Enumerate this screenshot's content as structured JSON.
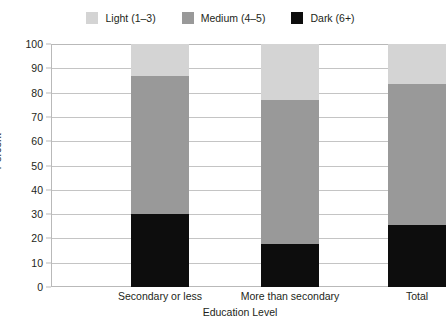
{
  "chart_data": {
    "type": "bar",
    "subtype": "stacked",
    "title": "",
    "xlabel": "Education Level",
    "ylabel": "Percent",
    "ylim": [
      0,
      100
    ],
    "yticks": [
      0,
      10,
      20,
      30,
      40,
      50,
      60,
      70,
      80,
      90,
      100
    ],
    "ytick_labels": [
      "0",
      "10",
      "20",
      "30",
      "40",
      "50",
      "60",
      "70",
      "80",
      "90",
      "100"
    ],
    "grid": true,
    "legend_position": "top-center",
    "categories": [
      "Secondary or less",
      "More than secondary",
      "Total"
    ],
    "series": [
      {
        "name": "Dark (6+)",
        "color": "#0d0d0d",
        "values": [
          30.0,
          17.5,
          25.5
        ]
      },
      {
        "name": "Medium (4–5)",
        "color": "#999999",
        "values": [
          57.0,
          59.5,
          58.0
        ]
      },
      {
        "name": "Light (1–3)",
        "color": "#d4d4d4",
        "values": [
          13.0,
          23.0,
          16.5
        ]
      }
    ],
    "cumulative_tops": {
      "Secondary or less": [
        30.0,
        87.0,
        100.0
      ],
      "More than secondary": [
        17.5,
        77.0,
        100.0
      ],
      "Total": [
        25.5,
        83.5,
        100.0
      ]
    }
  },
  "legend": {
    "items": [
      {
        "label": "Light (1–3)",
        "color": "#d4d4d4",
        "icon": "legend-swatch-light"
      },
      {
        "label": "Medium (4–5)",
        "color": "#999999",
        "icon": "legend-swatch-medium"
      },
      {
        "label": "Dark (6+)",
        "color": "#0d0d0d",
        "icon": "legend-swatch-dark"
      }
    ]
  },
  "axes": {
    "y_title": "Percent",
    "x_title": "Education Level"
  },
  "colors": {
    "light": "#d4d4d4",
    "medium": "#999999",
    "dark": "#0d0d0d",
    "grid": "#c4c4c4",
    "frame": "#b9b9b9",
    "text": "#231f20",
    "background": "#ffffff"
  }
}
